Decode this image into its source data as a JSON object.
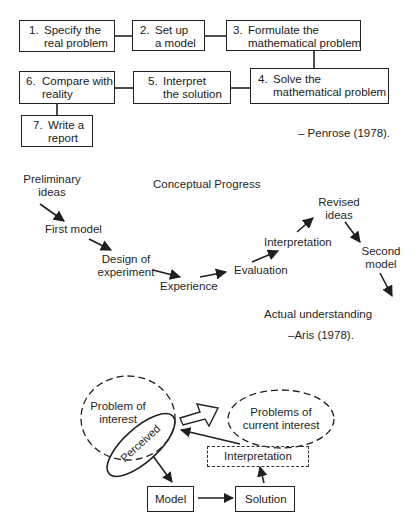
{
  "penrose": {
    "steps": [
      {
        "num": "1.",
        "line1": "Specify the",
        "line2": "real problem"
      },
      {
        "num": "2.",
        "line1": "Set up",
        "line2": "a model"
      },
      {
        "num": "3.",
        "line1": "Formulate the",
        "line2": "mathematical problem"
      },
      {
        "num": "4.",
        "line1": "Solve the",
        "line2": "mathematical problem"
      },
      {
        "num": "5.",
        "line1": "Interpret",
        "line2": "the solution"
      },
      {
        "num": "6.",
        "line1": "Compare with",
        "line2": "reality"
      },
      {
        "num": "7.",
        "line1": "Write a",
        "line2": "report"
      }
    ],
    "citation": "– Penrose (1978)."
  },
  "aris": {
    "title": "Conceptual Progress",
    "nodes": {
      "preliminary": {
        "line1": "Preliminary",
        "line2": "ideas"
      },
      "first_model": "First model",
      "design": {
        "line1": "Design of",
        "line2": "experiment"
      },
      "experience": "Experience",
      "evaluation": "Evaluation",
      "interpretation": "Interpretation",
      "revised": {
        "line1": "Revised",
        "line2": "ideas"
      },
      "second_model": {
        "line1": "Second",
        "line2": "model"
      }
    },
    "baseline": "Actual understanding",
    "citation": "–Aris (1978)."
  },
  "cycle": {
    "problem_of_interest": {
      "line1": "Problem of",
      "line2": "interest"
    },
    "perceived": "Perceived",
    "problems_current": {
      "line1": "Problems of",
      "line2": "current interest"
    },
    "interpretation": "Interpretation",
    "model": "Model",
    "solution": "Solution"
  },
  "colors": {
    "ink": "#1f1f1f",
    "background": "#ffffff"
  }
}
